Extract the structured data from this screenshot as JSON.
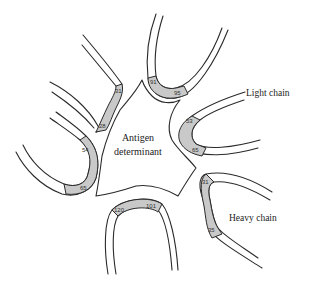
{
  "diagram": {
    "center_label_line1": "Antigen",
    "center_label_line2": "determinant",
    "light_chain_label": "Light chain",
    "heavy_chain_label": "Heavy chain",
    "residue_numbers": {
      "top_left_upper": "31",
      "top_left_lower": "28",
      "top_center_left": "91",
      "top_center_right": "95",
      "right_light_upper": "53",
      "right_light_lower": "65",
      "left_mid_upper": "54",
      "left_mid_lower": "65",
      "bottom_left": "120",
      "bottom_right": "101",
      "right_heavy_upper": "31",
      "right_heavy_lower": "35"
    },
    "colors": {
      "line": "#2a2a2a",
      "shading": "#c9c9c9",
      "background": "#ffffff"
    }
  }
}
